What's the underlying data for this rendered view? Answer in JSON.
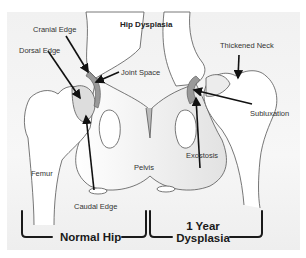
{
  "diagram": {
    "title": "Hip Dysplasia",
    "labels": {
      "cranial_edge": "Cranial Edge",
      "dorsal_edge": "Dorsal Edge",
      "joint_space": "Joint Space",
      "thickened_neck": "Thickened Neck",
      "subluxation": "Subluxation",
      "exostosis": "Exostosis",
      "femur": "Femur",
      "pelvis": "Pelvis",
      "caudal_edge": "Caudal Edge"
    },
    "sections": {
      "left": "Normal Hip",
      "right_line1": "1 Year",
      "right_line2": "Dysplasia"
    },
    "colors": {
      "background": "#f3f3f3",
      "bone_fill": "#ffffff",
      "outline": "#555555",
      "arrow": "#111111",
      "cartilage": "#9a9a9a"
    }
  }
}
